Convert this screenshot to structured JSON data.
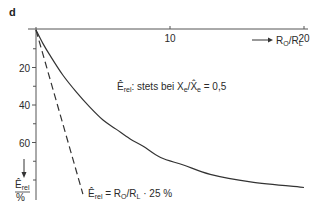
{
  "chart_data": {
    "type": "line",
    "panel_label": "d",
    "title": "",
    "xlabel": "R0/RL",
    "xlabel_arrow": "→",
    "ylabel": "Ê_rel",
    "ylabel_unit": "%",
    "ylabel_arrow": "↓",
    "x_range": [
      0,
      20
    ],
    "y_range": [
      0,
      90
    ],
    "y_inverted": true,
    "x_axis_position": "top",
    "grid": false,
    "x_ticks": [
      {
        "value": 10,
        "label": "10"
      },
      {
        "value": 20,
        "label": "20"
      }
    ],
    "x_minor_ticks": [],
    "y_ticks": [
      {
        "value": 20,
        "label": "20"
      },
      {
        "value": 40,
        "label": "40"
      },
      {
        "value": 60,
        "label": "60"
      }
    ],
    "y_minor_ticks": [
      10,
      30,
      50,
      70,
      80
    ],
    "series": [
      {
        "name": "Ê_rel stets bei Xe/X̂e = 0,5",
        "style": "solid",
        "x": [
          0,
          0.5,
          1,
          2,
          3,
          4,
          5,
          6,
          7,
          8,
          9.3,
          11,
          13,
          16,
          20
        ],
        "y": [
          0,
          7,
          13,
          24,
          33,
          41,
          48,
          53,
          58,
          62,
          68,
          72,
          77,
          81,
          84
        ]
      },
      {
        "name": "Ê_rel = R0/RL · 25 %",
        "style": "dashed",
        "x": [
          0,
          3.5
        ],
        "y": [
          0,
          87.5
        ]
      }
    ],
    "annotations": [
      {
        "id": "curve_note",
        "parts": {
          "e": "Ê",
          "e_sub": "rel",
          "text1": ": stets bei X",
          "x_sub1": "e",
          "slash": "/X̂",
          "x_sub2": "e",
          "text2": " = 0,5"
        }
      },
      {
        "id": "dashed_note",
        "parts": {
          "e": "Ê",
          "e_sub": "rel",
          "text1": " = R",
          "r_sub1": "O",
          "slash": "/R",
          "r_sub2": "L",
          "text2": " · 25 %"
        }
      }
    ],
    "xlabel_parts": {
      "r": "R",
      "sub1": "O",
      "slash": "/R",
      "sub2": "L"
    },
    "ylabel_parts": {
      "e": "Ê",
      "sub": "rel",
      "unit": "%"
    }
  }
}
